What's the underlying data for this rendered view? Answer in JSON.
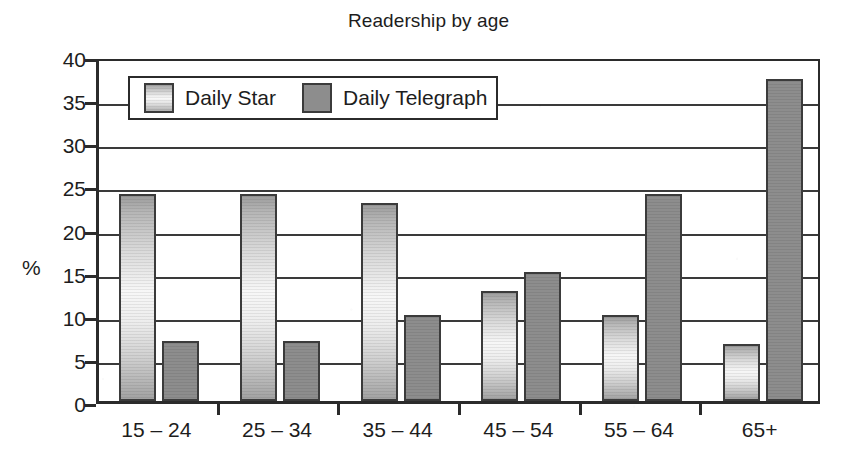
{
  "chart_data": {
    "type": "bar",
    "title": "Readership by age",
    "xlabel": "",
    "ylabel": "%",
    "ylim": [
      0,
      40
    ],
    "yticks": [
      0,
      5,
      10,
      15,
      20,
      25,
      30,
      35,
      40
    ],
    "ytick_labels": [
      "0",
      "5",
      "10",
      "15",
      "20",
      "25",
      "30",
      "35",
      "40"
    ],
    "grid": true,
    "legend_position": "upper-left-inside",
    "categories": [
      "15 – 24",
      "25 – 34",
      "35 – 44",
      "45 – 54",
      "55 – 64",
      "65+"
    ],
    "series": [
      {
        "name": "Daily Star",
        "color": "#e8e8e8",
        "values": [
          24,
          24,
          23,
          12.8,
          10,
          6.6
        ]
      },
      {
        "name": "Daily Telegraph",
        "color": "#8d8d8d",
        "values": [
          7,
          7,
          10,
          15,
          24,
          37.3
        ]
      }
    ]
  },
  "legend": {
    "entries": [
      {
        "label": "Daily Star"
      },
      {
        "label": "Daily Telegraph"
      }
    ]
  }
}
